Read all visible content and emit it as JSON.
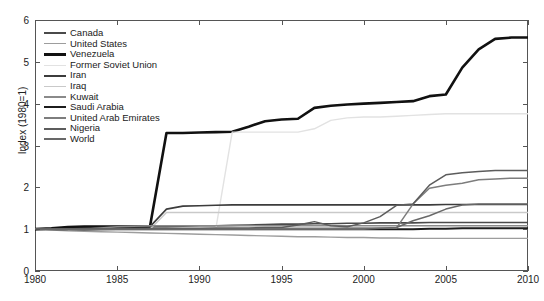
{
  "chart_data": {
    "type": "line",
    "title": "",
    "xlabel": "",
    "ylabel": "Index (1980=1)",
    "xlim": [
      1980,
      2010
    ],
    "ylim": [
      0,
      6
    ],
    "xticks": [
      1980,
      1985,
      1990,
      1995,
      2000,
      2005,
      2010
    ],
    "yticks": [
      0,
      1,
      2,
      3,
      4,
      5,
      6
    ],
    "grid": false,
    "legend_position": "upper left",
    "x": [
      1980,
      1981,
      1982,
      1983,
      1984,
      1985,
      1986,
      1987,
      1988,
      1989,
      1990,
      1991,
      1992,
      1993,
      1994,
      1995,
      1996,
      1997,
      1998,
      1999,
      2000,
      2001,
      2002,
      2003,
      2004,
      2005,
      2006,
      2007,
      2008,
      2009,
      2010
    ],
    "series": [
      {
        "name": "Canada",
        "color": "#4a4a4a",
        "width": 1.6,
        "values": [
          1.0,
          1.0,
          1.0,
          1.0,
          1.01,
          1.02,
          1.03,
          1.05,
          1.06,
          1.07,
          1.08,
          1.08,
          1.09,
          1.1,
          1.11,
          1.12,
          1.12,
          1.13,
          1.13,
          1.14,
          1.14,
          1.15,
          1.15,
          1.15,
          1.16,
          1.16,
          1.16,
          1.16,
          1.16,
          1.16,
          1.16
        ]
      },
      {
        "name": "United States",
        "color": "#9d9d9d",
        "width": 1.4,
        "values": [
          1.0,
          0.98,
          0.96,
          0.95,
          0.94,
          0.93,
          0.92,
          0.91,
          0.9,
          0.89,
          0.88,
          0.87,
          0.86,
          0.85,
          0.84,
          0.83,
          0.82,
          0.82,
          0.81,
          0.8,
          0.8,
          0.79,
          0.79,
          0.78,
          0.78,
          0.78,
          0.78,
          0.78,
          0.78,
          0.78,
          0.78
        ]
      },
      {
        "name": "Venezuela",
        "color": "#111111",
        "width": 2.6,
        "values": [
          1.0,
          1.02,
          1.05,
          1.06,
          1.06,
          1.06,
          1.06,
          1.07,
          3.3,
          3.3,
          3.31,
          3.32,
          3.33,
          3.45,
          3.58,
          3.62,
          3.64,
          3.9,
          3.95,
          3.98,
          4.0,
          4.02,
          4.04,
          4.06,
          4.18,
          4.22,
          4.86,
          5.3,
          5.55,
          5.58,
          5.58
        ]
      },
      {
        "name": "Former Soviet Union",
        "color": "#e2e2e2",
        "width": 1.4,
        "values": [
          1.0,
          1.0,
          1.0,
          1.0,
          1.0,
          1.0,
          1.0,
          1.0,
          1.0,
          1.0,
          1.0,
          1.0,
          3.32,
          3.32,
          3.32,
          3.32,
          3.32,
          3.4,
          3.6,
          3.66,
          3.68,
          3.68,
          3.7,
          3.72,
          3.74,
          3.76,
          3.76,
          3.76,
          3.76,
          3.76,
          3.76
        ]
      },
      {
        "name": "Iran",
        "color": "#3c3c3c",
        "width": 1.6,
        "values": [
          1.0,
          1.0,
          1.0,
          1.02,
          1.04,
          1.05,
          1.05,
          1.06,
          1.48,
          1.55,
          1.56,
          1.57,
          1.58,
          1.58,
          1.58,
          1.58,
          1.58,
          1.58,
          1.58,
          1.58,
          1.58,
          1.58,
          1.58,
          1.58,
          1.58,
          1.59,
          1.59,
          1.59,
          1.59,
          1.59,
          1.59
        ]
      },
      {
        "name": "Iraq",
        "color": "#c9c9c9",
        "width": 1.4,
        "values": [
          1.0,
          1.0,
          1.0,
          1.0,
          1.0,
          1.0,
          1.0,
          1.0,
          1.4,
          1.4,
          1.4,
          1.4,
          1.4,
          1.4,
          1.4,
          1.4,
          1.4,
          1.4,
          1.4,
          1.4,
          1.4,
          1.4,
          1.4,
          1.4,
          1.4,
          1.4,
          1.4,
          1.4,
          1.4,
          1.4,
          1.4
        ]
      },
      {
        "name": "Kuwait",
        "color": "#8a8a8a",
        "width": 1.5,
        "values": [
          1.0,
          1.0,
          1.0,
          1.0,
          1.03,
          1.06,
          1.07,
          1.08,
          1.08,
          1.08,
          1.08,
          1.08,
          1.08,
          1.08,
          1.08,
          1.08,
          1.08,
          1.08,
          1.08,
          1.08,
          1.08,
          1.08,
          1.08,
          1.08,
          1.08,
          1.08,
          1.08,
          1.08,
          1.08,
          1.08,
          1.08
        ]
      },
      {
        "name": "Saudi Arabia",
        "color": "#1c1c1c",
        "width": 2.0,
        "values": [
          1.0,
          1.0,
          1.0,
          1.0,
          1.0,
          1.0,
          1.0,
          1.0,
          1.0,
          1.0,
          1.0,
          1.0,
          1.0,
          1.0,
          1.0,
          1.0,
          1.0,
          1.0,
          1.0,
          1.0,
          1.0,
          1.0,
          1.0,
          1.0,
          1.01,
          1.01,
          1.02,
          1.02,
          1.02,
          1.02,
          1.02
        ]
      },
      {
        "name": "United Arab Emirates",
        "color": "#7d7d7d",
        "width": 1.5,
        "values": [
          1.0,
          1.0,
          1.0,
          1.0,
          1.0,
          1.0,
          1.0,
          1.0,
          1.0,
          1.0,
          1.01,
          1.01,
          1.01,
          1.01,
          1.01,
          1.02,
          1.02,
          1.02,
          1.02,
          1.03,
          1.03,
          1.03,
          1.03,
          1.6,
          1.98,
          2.05,
          2.1,
          2.18,
          2.2,
          2.22,
          2.22
        ]
      },
      {
        "name": "Nigeria",
        "color": "#5c5c5c",
        "width": 1.5,
        "values": [
          1.0,
          1.0,
          0.99,
          0.98,
          0.99,
          1.0,
          1.0,
          1.01,
          1.02,
          1.02,
          1.02,
          1.03,
          1.03,
          1.03,
          1.04,
          1.04,
          1.1,
          1.18,
          1.08,
          1.06,
          1.15,
          1.3,
          1.57,
          1.6,
          2.05,
          2.3,
          2.35,
          2.38,
          2.4,
          2.4,
          2.4
        ]
      },
      {
        "name": "World",
        "color": "#686868",
        "width": 1.5,
        "values": [
          1.0,
          1.0,
          1.0,
          1.0,
          1.0,
          1.0,
          1.0,
          1.0,
          1.0,
          1.0,
          1.0,
          1.0,
          1.0,
          1.0,
          1.0,
          1.0,
          1.0,
          1.0,
          1.0,
          1.0,
          1.0,
          1.02,
          1.04,
          1.2,
          1.32,
          1.48,
          1.58,
          1.6,
          1.6,
          1.6,
          1.6
        ]
      }
    ]
  },
  "axis": {
    "y_title": "Index (1980=1)",
    "y_tick_labels": [
      "0",
      "1",
      "2",
      "3",
      "4",
      "5",
      "6"
    ],
    "x_tick_labels": [
      "1980",
      "1985",
      "1990",
      "1995",
      "2000",
      "2005",
      "2010"
    ]
  },
  "caption": "",
  "colors": {
    "frame": "#555555",
    "background": "#ffffff",
    "text": "#1a1a1a"
  }
}
